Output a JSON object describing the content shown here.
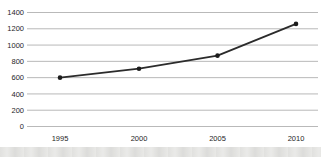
{
  "chart_data": {
    "type": "line",
    "title": "",
    "xlabel": "",
    "ylabel": "",
    "categories": [
      "1995",
      "2000",
      "2005",
      "2010"
    ],
    "series": [
      {
        "name": "series-1",
        "values": [
          600,
          710,
          870,
          1260
        ]
      }
    ],
    "ylim": [
      0,
      1400
    ],
    "ytick_step": 200,
    "ytick_labels": [
      "0",
      "200",
      "400",
      "600",
      "800",
      "1000",
      "1200",
      "1400"
    ],
    "grid": "horizontal-only",
    "legend": "none",
    "marker": "dot",
    "colors": {
      "line": "#2b2b2b",
      "marker": "#1c1c1c",
      "gridline": "#b9b9b9",
      "label": "#262626",
      "background": "#ffffff",
      "bottom_band": "#ececea"
    }
  }
}
